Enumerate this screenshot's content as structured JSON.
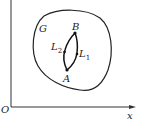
{
  "diagram": {
    "axes": {
      "origin_label": "O",
      "x_label": "x"
    },
    "region": {
      "label": "G"
    },
    "points": [
      {
        "label": "A"
      },
      {
        "label": "B"
      }
    ],
    "curves": [
      {
        "label": "L",
        "sub": "1"
      },
      {
        "label": "L",
        "sub": "2"
      }
    ],
    "colors": {
      "stroke": "#222222",
      "background": "#ffffff"
    }
  }
}
